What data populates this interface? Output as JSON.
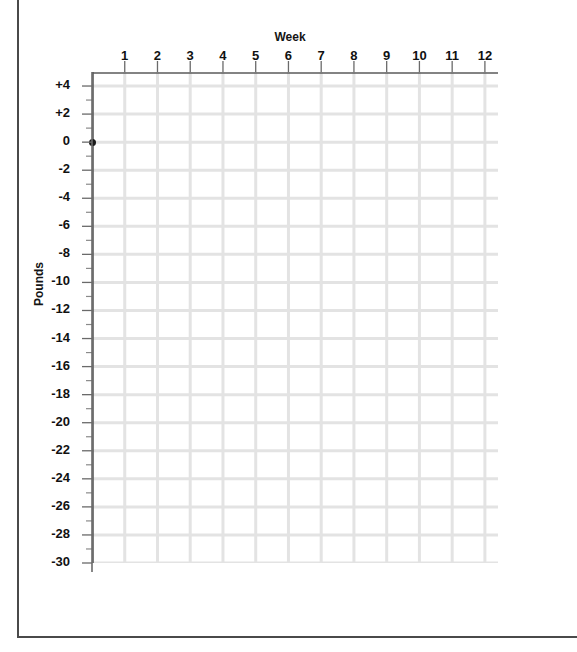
{
  "chart_data": {
    "type": "scatter",
    "title": "",
    "xlabel": "Week",
    "ylabel": "Pounds",
    "x_tick_labels": [
      "1",
      "2",
      "3",
      "4",
      "5",
      "6",
      "7",
      "8",
      "9",
      "10",
      "11",
      "12"
    ],
    "x_ticks": [
      1,
      2,
      3,
      4,
      5,
      6,
      7,
      8,
      9,
      10,
      11,
      12
    ],
    "y_tick_labels": [
      "+4",
      "+2",
      "0",
      "-2",
      "-4",
      "-6",
      "-8",
      "-10",
      "-12",
      "-14",
      "-16",
      "-18",
      "-20",
      "-22",
      "-24",
      "-26",
      "-28",
      "-30"
    ],
    "y_ticks": [
      4,
      2,
      0,
      -2,
      -4,
      -6,
      -8,
      -10,
      -12,
      -14,
      -16,
      -18,
      -20,
      -22,
      -24,
      -26,
      -28,
      -30
    ],
    "xlim": [
      0,
      12.4
    ],
    "ylim": [
      -30,
      5
    ],
    "y_major_step": 2,
    "y_minor_step": 1,
    "grid": true,
    "grid_color": "#e3e3e3",
    "axis_color": "#5a5a5a",
    "legend": null,
    "series": [
      {
        "name": "Weight change",
        "marker": "filled-circle",
        "color": "#1a1a1a",
        "points": [
          {
            "x": 0,
            "y": 0
          }
        ]
      }
    ]
  },
  "figure": {
    "x_axis_title": "Week",
    "y_axis_title": "Pounds"
  }
}
